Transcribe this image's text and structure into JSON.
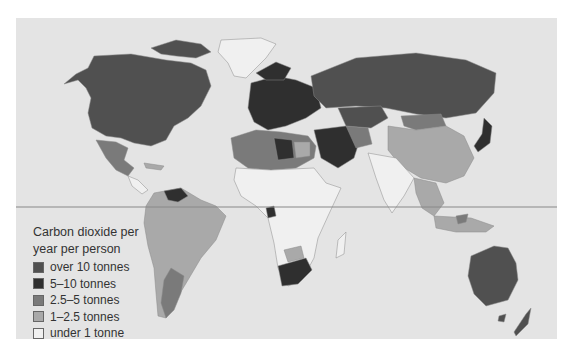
{
  "map": {
    "subject": "Carbon dioxide emissions per person",
    "equator_line": true
  },
  "legend": {
    "title_line1": "Carbon dioxide per",
    "title_line2": "year per person",
    "items": [
      {
        "label": "over 10 tonnes",
        "color": "#505050"
      },
      {
        "label": "5–10 tonnes",
        "color": "#2f2f2f"
      },
      {
        "label": "2.5–5 tonnes",
        "color": "#7a7a7a"
      },
      {
        "label": "1–2.5 tonnes",
        "color": "#a9a9a9"
      },
      {
        "label": "under 1 tonne",
        "color": "#f0f0f0"
      }
    ]
  },
  "colors": {
    "background": "#e4e4e4",
    "border": "#8a8a8a",
    "equator": "#888888"
  }
}
